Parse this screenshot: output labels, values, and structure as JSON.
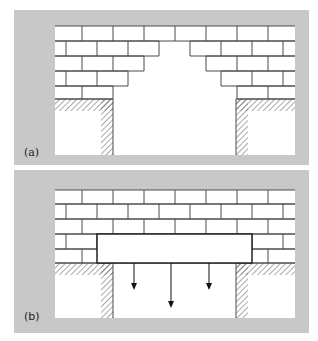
{
  "figure": {
    "colors": {
      "panel_background": "#c8c8c8",
      "inner_background": "#ffffff",
      "brick_line": "#4a4a4a",
      "hatch": "#555555",
      "lintel_stroke": "#222222",
      "arrow": "#111111"
    },
    "brick": {
      "width": 31,
      "odd_row_offset": 82,
      "even_row_offset": 66
    },
    "panels": [
      {
        "id": "a",
        "label": "(a)",
        "panel_rect": {
          "x": 14,
          "y": 10,
          "w": 295,
          "h": 155
        },
        "inner_rect": {
          "x": 55,
          "y": 26,
          "w": 240,
          "h": 129
        },
        "rows": [
          {
            "y": 26,
            "h": 15,
            "parity": "odd",
            "gap": null
          },
          {
            "y": 41,
            "h": 15,
            "parity": "even",
            "gap": [
              159,
              190
            ]
          },
          {
            "y": 56,
            "h": 15,
            "parity": "odd",
            "gap": [
              144,
              206
            ]
          },
          {
            "y": 71,
            "h": 15,
            "parity": "even",
            "gap": [
              128,
              221
            ]
          },
          {
            "y": 86,
            "h": 13,
            "parity": "odd",
            "gap": [
              113,
              237
            ]
          }
        ],
        "hatch_band_y": 99,
        "hatch_band_h": 12,
        "left_pier_x": 101,
        "right_pier_x": 236,
        "pier_w": 12,
        "label_pos": {
          "x": 24,
          "y": 156
        },
        "lintel": null,
        "arrows": []
      },
      {
        "id": "b",
        "label": "(b)",
        "panel_rect": {
          "x": 14,
          "y": 170,
          "w": 295,
          "h": 163
        },
        "inner_rect": {
          "x": 55,
          "y": 190,
          "w": 240,
          "h": 128
        },
        "rows": [
          {
            "y": 190,
            "h": 14,
            "parity": "odd",
            "gap": null
          },
          {
            "y": 204,
            "h": 15,
            "parity": "even",
            "gap": null
          },
          {
            "y": 219,
            "h": 15,
            "parity": "odd",
            "gap": null
          },
          {
            "y": 234,
            "h": 15,
            "parity": "even",
            "gap": null
          },
          {
            "y": 249,
            "h": 14,
            "parity": "odd",
            "gap": null
          }
        ],
        "hatch_band_y": 263,
        "hatch_band_h": 12,
        "left_pier_x": 101,
        "right_pier_x": 236,
        "pier_w": 12,
        "label_pos": {
          "x": 24,
          "y": 320
        },
        "lintel": {
          "x": 97,
          "y": 234,
          "w": 155,
          "h": 29
        },
        "arrows": [
          {
            "x": 134,
            "y1": 263,
            "y2": 290
          },
          {
            "x": 171,
            "y1": 263,
            "y2": 308
          },
          {
            "x": 209,
            "y1": 263,
            "y2": 290
          }
        ]
      }
    ]
  }
}
